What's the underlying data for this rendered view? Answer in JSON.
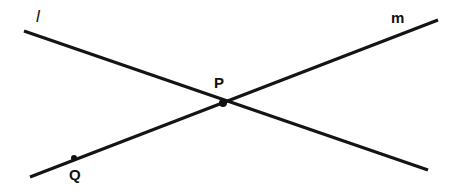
{
  "figure": {
    "type": "geometry-diagram",
    "width": 460,
    "height": 192,
    "background_color": "#ffffff",
    "stroke_color": "#141414",
    "label_color": "#111111",
    "lines": [
      {
        "id": "l",
        "label": "l",
        "label_style": "italic",
        "label_x": 41,
        "label_y": 15,
        "x1": 24,
        "y1": 31,
        "x2": 428,
        "y2": 170,
        "direction": "descending-left-to-right"
      },
      {
        "id": "m",
        "label": "m",
        "label_style": "upright",
        "label_x": 399,
        "label_y": 17,
        "x1": 30,
        "y1": 177,
        "x2": 438,
        "y2": 20,
        "direction": "ascending-left-to-right"
      }
    ],
    "points": [
      {
        "id": "P",
        "label": "P",
        "x": 223,
        "y": 103,
        "radius": 4,
        "label_position": "above",
        "label_x": 221,
        "label_y": 83,
        "on_lines": [
          "l",
          "m"
        ],
        "role": "intersection"
      },
      {
        "id": "Q",
        "label": "Q",
        "x": 74,
        "y": 158,
        "radius": 3,
        "label_position": "below",
        "label_x": 77,
        "label_y": 176,
        "on_lines": [
          "m"
        ],
        "role": "point-on-line"
      }
    ]
  }
}
